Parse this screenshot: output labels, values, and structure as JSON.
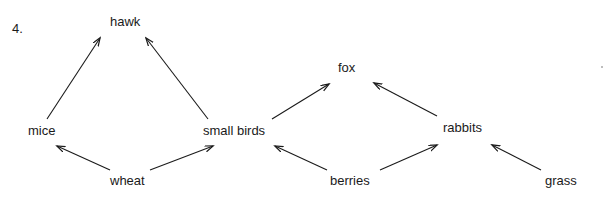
{
  "question": {
    "number": "4."
  },
  "diagram": {
    "type": "food-web",
    "nodes": [
      {
        "id": "hawk",
        "label": "hawk",
        "x": 110,
        "y": 22
      },
      {
        "id": "fox",
        "label": "fox",
        "x": 338,
        "y": 68
      },
      {
        "id": "mice",
        "label": "mice",
        "x": 28,
        "y": 131
      },
      {
        "id": "small-birds",
        "label": "small birds",
        "x": 203,
        "y": 131
      },
      {
        "id": "rabbits",
        "label": "rabbits",
        "x": 443,
        "y": 128
      },
      {
        "id": "wheat",
        "label": "wheat",
        "x": 110,
        "y": 181
      },
      {
        "id": "berries",
        "label": "berries",
        "x": 330,
        "y": 181
      },
      {
        "id": "grass",
        "label": "grass",
        "x": 545,
        "y": 181
      }
    ],
    "edges": [
      {
        "from": "mice",
        "to": "hawk"
      },
      {
        "from": "small-birds",
        "to": "hawk"
      },
      {
        "from": "wheat",
        "to": "mice"
      },
      {
        "from": "wheat",
        "to": "small-birds"
      },
      {
        "from": "small-birds",
        "to": "fox"
      },
      {
        "from": "rabbits",
        "to": "fox"
      },
      {
        "from": "berries",
        "to": "small-birds"
      },
      {
        "from": "berries",
        "to": "rabbits"
      },
      {
        "from": "grass",
        "to": "rabbits"
      }
    ],
    "colors": {
      "stroke": "#1a1a1a",
      "text": "#1a1a1a",
      "background": "#ffffff"
    }
  }
}
